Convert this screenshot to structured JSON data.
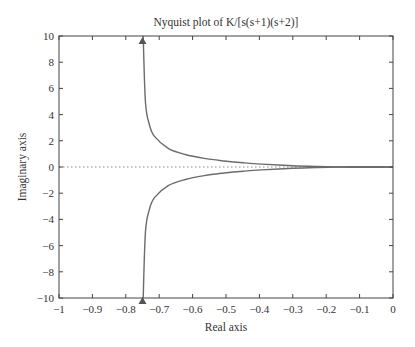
{
  "chart_data": {
    "type": "line",
    "title": "Nyquist plot of K/[s(s+1)(s+2)]",
    "xlabel": "Real axis",
    "ylabel": "Imaginary axis",
    "xlim": [
      -1,
      0
    ],
    "ylim": [
      -10,
      10
    ],
    "xticks": [
      -1,
      -0.9,
      -0.8,
      -0.7,
      -0.6,
      -0.5,
      -0.4,
      -0.3,
      -0.2,
      -0.1,
      0
    ],
    "xtick_labels": [
      "−1",
      "−0.9",
      "−0.8",
      "−0.7",
      "−0.6",
      "−0.5",
      "−0.4",
      "−0.3",
      "−0.2",
      "−0.1",
      "0"
    ],
    "yticks": [
      10,
      8,
      6,
      4,
      2,
      0,
      -2,
      -4,
      -6,
      -8,
      -10
    ],
    "ytick_labels": [
      "10",
      "8",
      "6",
      "4",
      "2",
      "0",
      "−2",
      "−4",
      "−6",
      "−8",
      "−10"
    ],
    "grid": false,
    "legend": null,
    "reference_line": {
      "y": 0,
      "style": "dotted"
    },
    "series": [
      {
        "name": "lower branch (ω > 0)",
        "x": [
          -0.748,
          -0.741,
          -0.729,
          -0.714,
          -0.673,
          -0.622,
          -0.565,
          -0.506,
          -0.448,
          -0.394,
          -0.3,
          -0.226,
          -0.167,
          -0.075,
          -0.023,
          -0.005,
          0
        ],
        "y": [
          -9.96,
          -4.91,
          -3.205,
          -2.333,
          -1.428,
          -0.953,
          -0.659,
          -0.461,
          -0.322,
          -0.223,
          -0.1,
          -0.035,
          0,
          0.025,
          0.018,
          0.005,
          0
        ]
      },
      {
        "name": "upper branch (ω < 0)",
        "x": [
          -0.748,
          -0.741,
          -0.729,
          -0.714,
          -0.673,
          -0.622,
          -0.565,
          -0.506,
          -0.448,
          -0.394,
          -0.3,
          -0.226,
          -0.167,
          -0.075,
          -0.023,
          -0.005,
          0
        ],
        "y": [
          9.96,
          4.91,
          3.205,
          2.333,
          1.428,
          0.953,
          0.659,
          0.461,
          0.322,
          0.223,
          0.1,
          0.035,
          0,
          -0.025,
          -0.018,
          -0.005,
          0
        ]
      }
    ],
    "annotations": [
      {
        "type": "arrow",
        "x": -0.75,
        "y": 10,
        "direction": "up"
      },
      {
        "type": "arrow",
        "x": -0.75,
        "y": -10,
        "direction": "up"
      }
    ],
    "colors": {
      "curve": "#6b6b6b",
      "axes": "#444444",
      "reference": "#888888",
      "arrow": "#555555"
    }
  }
}
